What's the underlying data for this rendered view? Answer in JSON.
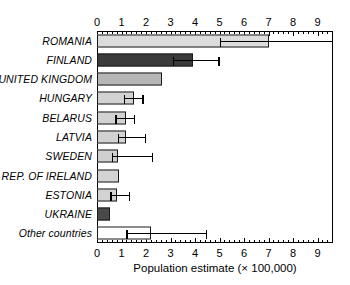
{
  "chart_data": {
    "type": "bar",
    "orientation": "horizontal",
    "title": "",
    "xlabel": "Population estimate (× 100,000)",
    "ylabel": "",
    "xlim": [
      0,
      9.63
    ],
    "xticks": [
      0,
      1,
      2,
      3,
      4,
      5,
      6,
      7,
      8,
      9
    ],
    "xtick_labels": [
      "0",
      "1",
      "2",
      "3",
      "4",
      "5",
      "6",
      "7",
      "8",
      "9"
    ],
    "minor_ticks_per_interval": 4,
    "grid": false,
    "legend": null,
    "axis_ticks_top": true,
    "axis_ticks_bottom": true,
    "categories": [
      "ROMANIA",
      "FINLAND",
      "UNITED KINGDOM",
      "HUNGARY",
      "BELARUS",
      "LATVIA",
      "SWEDEN",
      "REP. OF IRELAND",
      "ESTONIA",
      "UKRAINE",
      "Other countries"
    ],
    "values": [
      7.0,
      3.9,
      2.65,
      1.5,
      1.2,
      1.2,
      0.85,
      0.9,
      0.8,
      0.55,
      2.2
    ],
    "errors_low": [
      5.0,
      3.1,
      null,
      1.1,
      0.75,
      0.85,
      0.6,
      null,
      0.55,
      null,
      1.2
    ],
    "errors_high": [
      9.63,
      5.0,
      null,
      1.9,
      1.55,
      2.0,
      2.3,
      null,
      1.35,
      null,
      4.5
    ],
    "fills": [
      "#dcdcdc",
      "#3a3a3a",
      "#b6b6b6",
      "#d2d2d2",
      "#d2d2d2",
      "#d2d2d2",
      "#cfcfcf",
      "#d2d2d2",
      "#d2d2d2",
      "#4a4a4a",
      "#ffffff"
    ],
    "bar_edge_color": "#1a1a1a",
    "error_bar_color": "#000000",
    "axis_color": "#000000",
    "background": "#ffffff"
  }
}
